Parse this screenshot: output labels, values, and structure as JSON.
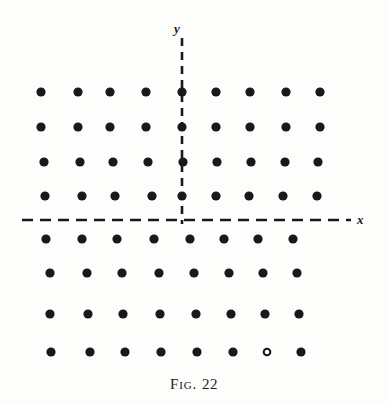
{
  "figure": {
    "caption_prefix": "Fig.",
    "caption_number": "22",
    "caption_full": "FIG. 22",
    "background_color": "#fdfdfc",
    "ink_color": "#19181a"
  },
  "axes": {
    "x_label": "x",
    "y_label": "y",
    "style": "dashed",
    "origin": {
      "x": 182,
      "y": 220
    },
    "x_axis": {
      "start_x": 22,
      "end_x": 351,
      "y": 220
    },
    "y_axis": {
      "x": 182,
      "start_y": 38,
      "end_y": 224
    }
  },
  "chart_data": {
    "type": "scatter",
    "xlabel": "x",
    "ylabel": "y",
    "grid": false,
    "legend": null,
    "xlim": [
      0,
      388
    ],
    "ylim": [
      0,
      372
    ],
    "marker": "filled-circle",
    "marker_radius_px": 4.6,
    "rows": [
      {
        "index": 0,
        "y": 92,
        "count": 9,
        "points_x": [
          41,
          78,
          110,
          146,
          182,
          216,
          250,
          286,
          320
        ]
      },
      {
        "index": 1,
        "y": 127,
        "count": 9,
        "points_x": [
          41,
          78,
          110,
          146,
          182,
          216,
          250,
          286,
          320
        ]
      },
      {
        "index": 2,
        "y": 162,
        "count": 9,
        "points_x": [
          44,
          80,
          113,
          148,
          183,
          217,
          251,
          285,
          318
        ]
      },
      {
        "index": 3,
        "y": 196,
        "count": 9,
        "points_x": [
          45,
          82,
          115,
          152,
          182,
          216,
          249,
          283,
          317
        ]
      },
      {
        "index": 4,
        "y": 239,
        "count": 8,
        "points_x": [
          46,
          82,
          117,
          154,
          190,
          224,
          258,
          293
        ]
      },
      {
        "index": 5,
        "y": 273,
        "count": 8,
        "points_x": [
          50,
          87,
          122,
          159,
          194,
          229,
          263,
          297
        ]
      },
      {
        "index": 6,
        "y": 314,
        "count": 8,
        "points_x": [
          50,
          88,
          123,
          160,
          196,
          231,
          265,
          299
        ]
      },
      {
        "index": 7,
        "y": 352,
        "count": 8,
        "points_x": [
          51,
          90,
          125,
          161,
          197,
          233,
          267,
          301
        ]
      }
    ],
    "special_points": [
      {
        "row": 7,
        "column": 6,
        "x": 267,
        "y": 352,
        "marker": "hollow-circle",
        "note": "printed as a faint ring rather than a solid dot"
      }
    ],
    "total_points": 68
  }
}
